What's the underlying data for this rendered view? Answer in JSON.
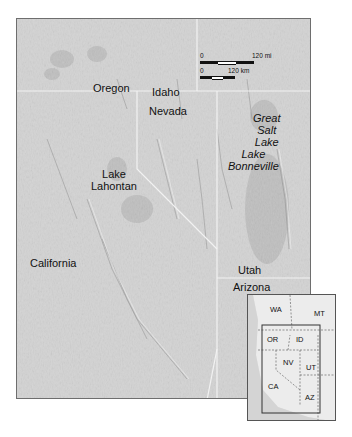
{
  "map": {
    "labels": {
      "oregon": "Oregon",
      "idaho": "Idaho",
      "nevada": "Nevada",
      "great_salt_lake": [
        "Great",
        "Salt",
        "Lake"
      ],
      "lake_bonneville": [
        "Lake",
        "Bonneville"
      ],
      "lake_lahontan": [
        "Lake",
        "Lahontan"
      ],
      "california": "California",
      "utah": "Utah",
      "arizona": "Arizona"
    },
    "scale_bar": {
      "miles": {
        "start": "0",
        "end": "120 mi"
      },
      "km": {
        "start": "0",
        "end": "120 km"
      }
    }
  },
  "inset": {
    "states": [
      "WA",
      "MT",
      "OR",
      "ID",
      "NV",
      "UT",
      "CA",
      "AZ"
    ]
  },
  "colors": {
    "relief_base": "#cfcfcf",
    "lake_shading": "#bdbdbd",
    "border_line": "#f2f2f2",
    "frame": "#6e6e6e"
  }
}
